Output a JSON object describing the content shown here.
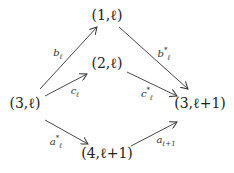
{
  "diagram": {
    "nodes": [
      {
        "id": "n1l",
        "label": "(1,ℓ)",
        "x": 107,
        "y": 15
      },
      {
        "id": "n2l",
        "label": "(2,ℓ)",
        "x": 107,
        "y": 63
      },
      {
        "id": "n3l",
        "label": "(3,ℓ)",
        "x": 25,
        "y": 103
      },
      {
        "id": "n3l1",
        "label": "(3,ℓ+1)",
        "x": 200,
        "y": 103
      },
      {
        "id": "n4l1",
        "label": "(4,ℓ+1)",
        "x": 107,
        "y": 153
      }
    ],
    "edges": [
      {
        "from": "n3l",
        "to": "n1l",
        "label": "bℓ",
        "base": "b",
        "sub": "ℓ",
        "sup": ""
      },
      {
        "from": "n3l",
        "to": "n2l",
        "label": "cℓ",
        "base": "c",
        "sub": "ℓ",
        "sup": ""
      },
      {
        "from": "n1l",
        "to": "n3l1",
        "label": "b*ℓ",
        "base": "b",
        "sub": "ℓ",
        "sup": "*"
      },
      {
        "from": "n2l",
        "to": "n3l1",
        "label": "c*ℓ",
        "base": "c",
        "sub": "ℓ",
        "sup": "*"
      },
      {
        "from": "n3l",
        "to": "n4l1",
        "label": "a*ℓ",
        "base": "a",
        "sub": "ℓ",
        "sup": "*"
      },
      {
        "from": "n4l1",
        "to": "n3l1",
        "label": "aℓ+1",
        "base": "a",
        "sub": "ℓ+1",
        "sup": ""
      }
    ]
  }
}
